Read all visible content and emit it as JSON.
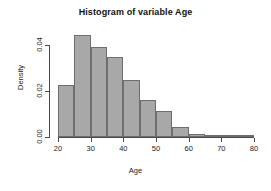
{
  "chart_data": {
    "type": "bar",
    "title": "Histogram of variable Age",
    "xlabel": "Age",
    "ylabel": "Density",
    "xlim": [
      20,
      80
    ],
    "ylim": [
      0,
      0.047
    ],
    "grid": false,
    "legend": null,
    "bin_width": 5,
    "bin_edges": [
      20,
      25,
      30,
      35,
      40,
      45,
      50,
      55,
      60,
      65,
      70,
      75,
      80
    ],
    "categories": [
      "20-25",
      "25-30",
      "30-35",
      "35-40",
      "40-45",
      "45-50",
      "50-55",
      "55-60",
      "60-65",
      "65-70",
      "70-75",
      "75-80"
    ],
    "values": [
      0.0228,
      0.0444,
      0.0392,
      0.0348,
      0.0248,
      0.016,
      0.0112,
      0.0042,
      0.0012,
      0.0008,
      0.0,
      0.0
    ],
    "xticks": [
      20,
      30,
      40,
      50,
      60,
      70,
      80
    ],
    "xtick_labels": [
      "20",
      "30",
      "40",
      "50",
      "60",
      "70",
      "80"
    ],
    "yticks": [
      0.0,
      0.02,
      0.04
    ],
    "ytick_labels": [
      "0.00",
      "0.02",
      "0.04"
    ],
    "bar_fill_color": "#a8a8a8",
    "bar_border_color": "#6e6e6e",
    "axis_color": "#4a4a4a"
  }
}
